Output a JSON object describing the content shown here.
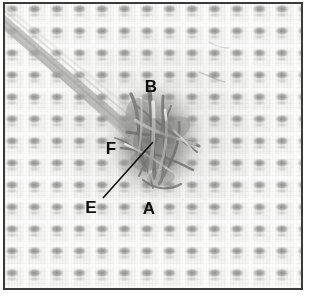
{
  "figure": {
    "kind": "annotated-photomicrograph",
    "palette": {
      "background": "#ffffff",
      "frame_border": "#3a3a3a",
      "fabric_base": "#f4f4f2",
      "weave_knuckle": "#767674",
      "fibre_mass_dark": "#6e6e6c",
      "fibre_mass_mid": "#9a9a98",
      "fibre_highlight": "#ffffff",
      "label_text": "#0e0e0e",
      "leader_line": "#101010"
    },
    "frame": {
      "x": 3,
      "y": 2,
      "width": 300,
      "height": 288,
      "border_width": 2
    },
    "weave": {
      "columns": 13,
      "rows": 13,
      "cell_width_px": 22.5,
      "cell_height_px": 22
    }
  },
  "labels": [
    {
      "id": "label-b",
      "text": "B",
      "x": 151,
      "y": 92,
      "has_leader": false
    },
    {
      "id": "label-f",
      "text": "F",
      "x": 111,
      "y": 154,
      "has_leader": false
    },
    {
      "id": "label-e",
      "text": "E",
      "x": 91,
      "y": 213,
      "has_leader": true
    },
    {
      "id": "label-a",
      "text": "A",
      "x": 149,
      "y": 214,
      "has_leader": false
    }
  ],
  "leader_lines": [
    {
      "id": "leader-e",
      "from_label": "E",
      "x1": 103,
      "y1": 198,
      "x2": 153,
      "y2": 142
    }
  ],
  "features": {
    "fibre_bundle_streak": {
      "name": "diagonal fibre bundle",
      "description": "pale fibre bundle running from upper-left corner toward the central tangle",
      "x1": 2,
      "y1": 14,
      "x2": 140,
      "y2": 132
    },
    "central_tangle": {
      "name": "entangled fibre mass",
      "cx": 155,
      "cy": 140,
      "rx": 48,
      "ry": 58
    }
  }
}
